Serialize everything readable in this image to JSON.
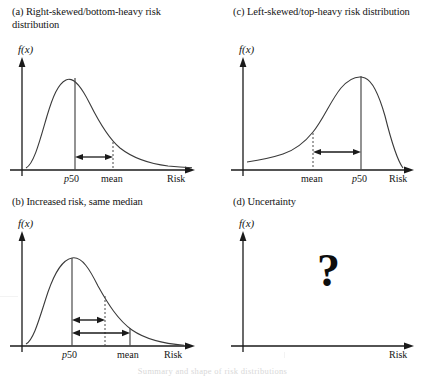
{
  "figure": {
    "panels": [
      {
        "id": "a",
        "title": "(a) Right-skewed/bottom-heavy risk distribution",
        "ylabel": "f(x)",
        "xlabel": "Risk",
        "marker_median": "p50",
        "marker_mean": "mean",
        "question_mark": ""
      },
      {
        "id": "c",
        "title": "(c) Left-skewed/top-heavy risk distribution",
        "ylabel": "f(x)",
        "xlabel": "Risk",
        "marker_median": "p50",
        "marker_mean": "mean",
        "question_mark": ""
      },
      {
        "id": "b",
        "title": "(b) Increased risk, same median",
        "ylabel": "f(x)",
        "xlabel": "Risk",
        "marker_median": "p50",
        "marker_mean": "mean",
        "question_mark": ""
      },
      {
        "id": "d",
        "title": "(d) Uncertainty",
        "ylabel": "f(x)",
        "xlabel": "Risk",
        "marker_median": "",
        "marker_mean": "",
        "question_mark": "?"
      }
    ],
    "bottom_caption": "Summary and shape of risk distributions"
  },
  "chart_data": [
    {
      "type": "line",
      "panel": "a",
      "title": "(a) Right-skewed/bottom-heavy risk distribution",
      "xlabel": "Risk",
      "ylabel": "f(x)",
      "grid": false,
      "legend": "none",
      "description": "Right-skewed (positively skewed) probability density; mode left of median, mean to the right of median; horizontal double arrow spans p50 to mean.",
      "annotations": [
        {
          "label": "p50",
          "x": 0.3,
          "line": "solid",
          "note": "median at mode-right position"
        },
        {
          "label": "mean",
          "x": 0.52,
          "line": "dotted",
          "note": "mean right of median"
        },
        {
          "label": "spread-arrow",
          "from_x": 0.3,
          "to_x": 0.52,
          "type": "double-headed"
        }
      ],
      "x": [
        0.0,
        0.05,
        0.1,
        0.15,
        0.2,
        0.25,
        0.3,
        0.35,
        0.4,
        0.45,
        0.5,
        0.55,
        0.6,
        0.65,
        0.7,
        0.75,
        0.8,
        0.85,
        0.9,
        0.95,
        1.0
      ],
      "y": [
        0.08,
        0.3,
        0.62,
        0.88,
        0.99,
        0.98,
        0.88,
        0.75,
        0.62,
        0.5,
        0.4,
        0.32,
        0.26,
        0.21,
        0.17,
        0.14,
        0.12,
        0.1,
        0.09,
        0.08,
        0.07
      ],
      "xlim": [
        0,
        1
      ],
      "ylim": [
        0,
        1.05
      ]
    },
    {
      "type": "line",
      "panel": "c",
      "title": "(c) Left-skewed/top-heavy risk distribution",
      "xlabel": "Risk",
      "ylabel": "f(x)",
      "grid": false,
      "legend": "none",
      "description": "Left-skewed (negatively skewed) probability density; long left tail, mode near right; mean lies left of median; horizontal double arrow spans mean to p50.",
      "annotations": [
        {
          "label": "mean",
          "x": 0.48,
          "line": "dotted",
          "note": "mean left of median"
        },
        {
          "label": "p50",
          "x": 0.7,
          "line": "solid",
          "note": "median near mode"
        },
        {
          "label": "spread-arrow",
          "from_x": 0.48,
          "to_x": 0.7,
          "type": "double-headed"
        }
      ],
      "x": [
        0.0,
        0.05,
        0.1,
        0.15,
        0.2,
        0.25,
        0.3,
        0.35,
        0.4,
        0.45,
        0.5,
        0.55,
        0.6,
        0.65,
        0.7,
        0.75,
        0.8,
        0.85,
        0.9,
        0.95,
        1.0
      ],
      "y": [
        0.07,
        0.08,
        0.09,
        0.1,
        0.12,
        0.14,
        0.17,
        0.21,
        0.26,
        0.32,
        0.4,
        0.52,
        0.68,
        0.84,
        0.96,
        1.0,
        0.97,
        0.84,
        0.6,
        0.32,
        0.1
      ],
      "xlim": [
        0,
        1
      ],
      "ylim": [
        0,
        1.05
      ]
    },
    {
      "type": "line",
      "panel": "b",
      "title": "(b) Increased risk, same median",
      "xlabel": "Risk",
      "ylabel": "f(x)",
      "grid": false,
      "legend": "none",
      "description": "Right-skewed density with a heavier/longer right tail; median (p50) unchanged while the mean moves further right. Two stacked double-headed arrows compare the original (shorter) and increased (longer) median-to-mean gap.",
      "annotations": [
        {
          "label": "p50",
          "x": 0.28,
          "line": "solid",
          "note": "median unchanged"
        },
        {
          "label": "original-mean",
          "x": 0.46,
          "line": "dotted",
          "note": "previous mean position"
        },
        {
          "label": "mean",
          "x": 0.6,
          "line": "solid",
          "note": "increased mean"
        },
        {
          "label": "spread-arrow-short",
          "from_x": 0.28,
          "to_x": 0.46,
          "type": "double-headed"
        },
        {
          "label": "spread-arrow-long",
          "from_x": 0.28,
          "to_x": 0.6,
          "type": "double-headed"
        }
      ],
      "x": [
        0.0,
        0.05,
        0.1,
        0.15,
        0.2,
        0.25,
        0.3,
        0.35,
        0.4,
        0.45,
        0.5,
        0.55,
        0.6,
        0.65,
        0.7,
        0.75,
        0.8,
        0.85,
        0.9,
        0.95,
        1.0
      ],
      "y": [
        0.06,
        0.26,
        0.58,
        0.85,
        0.98,
        1.0,
        0.95,
        0.86,
        0.75,
        0.64,
        0.54,
        0.45,
        0.37,
        0.3,
        0.25,
        0.2,
        0.17,
        0.14,
        0.12,
        0.1,
        0.09
      ],
      "xlim": [
        0,
        1
      ],
      "ylim": [
        0,
        1.05
      ]
    },
    {
      "type": "line",
      "panel": "d",
      "title": "(d) Uncertainty",
      "xlabel": "Risk",
      "ylabel": "f(x)",
      "grid": false,
      "legend": "none",
      "description": "Empty axes with a large question mark in the plotting area, denoting an unknown risk distribution.",
      "annotations": [
        {
          "label": "question-mark",
          "x": 0.52,
          "y": 0.58,
          "text": "?"
        }
      ],
      "x": [],
      "y": [],
      "xlim": [
        0,
        1
      ],
      "ylim": [
        0,
        1.05
      ]
    }
  ]
}
